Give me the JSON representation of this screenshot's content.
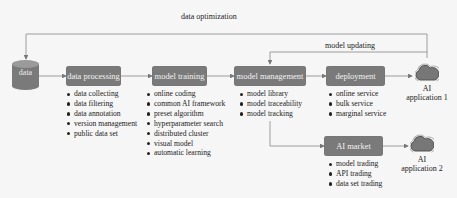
{
  "feedback": {
    "data_optimization": "data optimization",
    "model_updating": "model updating"
  },
  "data_store": {
    "label": "data",
    "icon": "database-cylinder-icon"
  },
  "stages": [
    {
      "label": "data processing",
      "items": [
        "data collecting",
        "data filtering",
        "data annotation",
        "version management",
        "public data set"
      ]
    },
    {
      "label": "model training",
      "items": [
        "online coding",
        "common AI framework",
        "preset algorithm",
        "hyperparameter search",
        "distributed cluster",
        "visual model",
        "automatic learning"
      ]
    },
    {
      "label": "model management",
      "items": [
        "model library",
        "model traceability",
        "model tracking"
      ]
    },
    {
      "label": "deployment",
      "items": [
        "online service",
        "bulk service",
        "marginal service"
      ]
    },
    {
      "label": "AI market",
      "items": [
        "model trading",
        "API trading",
        "data set trading"
      ]
    }
  ],
  "applications": [
    {
      "line1": "AI",
      "line2": "application 1",
      "icon": "cloud-icon"
    },
    {
      "line1": "AI",
      "line2": "application 2",
      "icon": "cloud-icon"
    }
  ],
  "colors": {
    "box_fill": "#7a7a7a",
    "box_text": "#f2f2f2",
    "line": "#777777",
    "background": "#f6f6f6"
  }
}
